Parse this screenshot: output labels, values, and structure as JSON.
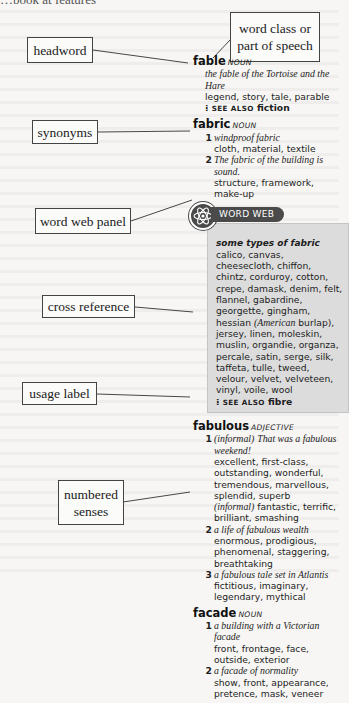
{
  "page": {
    "top_fragment": "…book at features"
  },
  "labels": {
    "headword": "headword",
    "word_class": [
      "word class or",
      "part of speech"
    ],
    "synonyms": "synonyms",
    "word_web_panel": "word web panel",
    "cross_reference": "cross reference",
    "usage_label": "usage label",
    "numbered_senses": [
      "numbered",
      "senses"
    ]
  },
  "entries": {
    "fable": {
      "headword": "fable",
      "pos": "noun",
      "example": "the fable of the Tortoise and the Hare",
      "synonyms": "legend, story, tale, parable",
      "see_also_label": "see also",
      "see_also": "fiction"
    },
    "fabric": {
      "headword": "fabric",
      "pos": "noun",
      "senses": [
        {
          "num": "1",
          "example": "windproof fabric",
          "synonyms": "cloth, material, textile"
        },
        {
          "num": "2",
          "example": "The fabric of the building is sound.",
          "synonyms": "structure, framework, make-up"
        }
      ],
      "word_web": {
        "tab": "WORD WEB",
        "title": "some types of fabric",
        "items_1": "calico, canvas, cheesecloth, chiffon, chintz, corduroy, cotton, crepe, damask, denim, felt, flannel, gabardine, georgette, gingham, hessian",
        "items_note": "(American",
        "items_note2": "burlap),",
        "items_2": "jersey, linen, moleskin, muslin, organdie, organza, percale, satin, serge, silk, taffeta, tulle, tweed, velour, velvet, velveteen, vinyl, voile, wool",
        "see_also_label": "see also",
        "see_also": "fibre"
      }
    },
    "fabulous": {
      "headword": "fabulous",
      "pos": "adjective",
      "senses": [
        {
          "num": "1",
          "usage": "(informal)",
          "example": "That was a fabulous weekend!",
          "synonyms": "excellent, first-class, outstanding, wonderful, tremendous, marvellous, splendid, superb",
          "usage2": "(informal)",
          "synonyms2": "fantastic, terrific, brilliant, smashing"
        },
        {
          "num": "2",
          "example": "a life of fabulous wealth",
          "synonyms": "enormous, prodigious, phenomenal, staggering, breathtaking"
        },
        {
          "num": "3",
          "example": "a fabulous tale set in Atlantis",
          "synonyms": "fictitious, imaginary, legendary, mythical"
        }
      ]
    },
    "facade": {
      "headword": "facade",
      "pos": "noun",
      "senses": [
        {
          "num": "1",
          "example": "a building with a Victorian facade",
          "synonyms": "front, frontage, face, outside, exterior"
        },
        {
          "num": "2",
          "example": "a facade of normality",
          "synonyms": "show, front, appearance, pretence, mask, veneer"
        }
      ]
    }
  },
  "colors": {
    "panel_bg": "#dcdcdc",
    "tab_bg": "#4a4a4a",
    "page_bg": "#f7f6f4"
  }
}
